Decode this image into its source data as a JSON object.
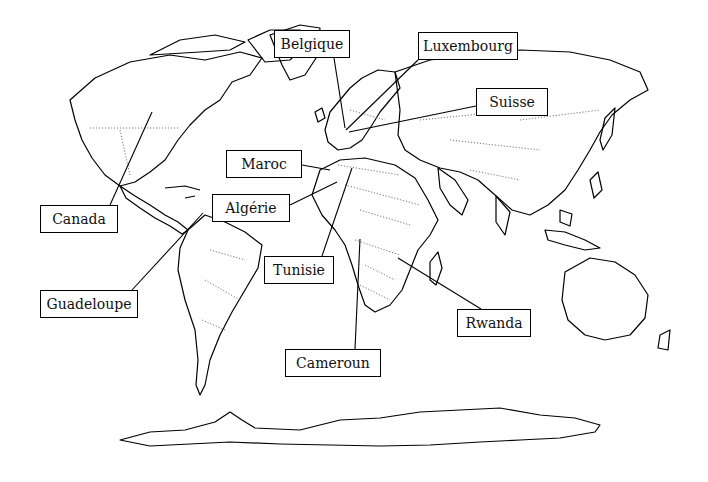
{
  "diagram": {
    "type": "world-map-annotated",
    "labels": [
      {
        "id": "belgique",
        "text": "Belgique",
        "box": [
          274,
          30,
          76,
          28
        ],
        "line": [
          [
            334,
            58
          ],
          [
            345,
            128
          ]
        ]
      },
      {
        "id": "luxembourg",
        "text": "Luxembourg",
        "box": [
          418,
          32,
          100,
          28
        ],
        "line": [
          [
            418,
            60
          ],
          [
            346,
            130
          ]
        ]
      },
      {
        "id": "suisse",
        "text": "Suisse",
        "box": [
          476,
          88,
          72,
          28
        ],
        "line": [
          [
            476,
            106
          ],
          [
            349,
            132
          ]
        ]
      },
      {
        "id": "maroc",
        "text": "Maroc",
        "box": [
          226,
          150,
          76,
          28
        ],
        "line": [
          [
            302,
            165
          ],
          [
            330,
            170
          ]
        ]
      },
      {
        "id": "algerie",
        "text": "Algérie",
        "box": [
          212,
          194,
          78,
          28
        ],
        "line": [
          [
            290,
            205
          ],
          [
            337,
            182
          ]
        ]
      },
      {
        "id": "tunisie",
        "text": "Tunisie",
        "box": [
          264,
          256,
          70,
          28
        ],
        "line": [
          [
            322,
            256
          ],
          [
            352,
            168
          ]
        ]
      },
      {
        "id": "canada",
        "text": "Canada",
        "box": [
          40,
          205,
          78,
          28
        ],
        "line": [
          [
            110,
            205
          ],
          [
            152,
            112
          ]
        ]
      },
      {
        "id": "guadeloupe",
        "text": "Guadeloupe",
        "box": [
          40,
          290,
          98,
          28
        ],
        "line": [
          [
            132,
            290
          ],
          [
            203,
            213
          ]
        ]
      },
      {
        "id": "rwanda",
        "text": "Rwanda",
        "box": [
          457,
          309,
          74,
          28
        ],
        "line": [
          [
            481,
            309
          ],
          [
            398,
            258
          ]
        ]
      },
      {
        "id": "cameroun",
        "text": "Cameroun",
        "box": [
          285,
          349,
          96,
          28
        ],
        "line": [
          [
            355,
            349
          ],
          [
            360,
            239
          ]
        ]
      }
    ]
  }
}
